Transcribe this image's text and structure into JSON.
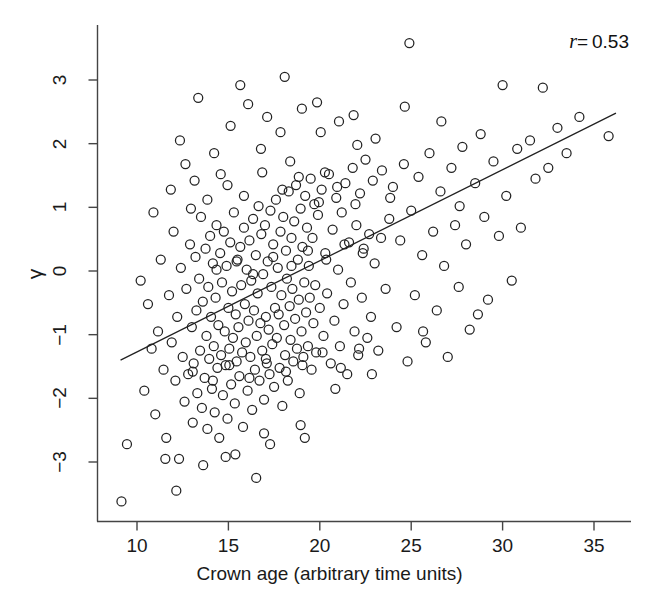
{
  "chart_data": {
    "type": "scatter",
    "title": "",
    "xlabel": "Crown age (arbitrary time units)",
    "ylabel": "γ",
    "xlim": [
      8.4,
      37.2
    ],
    "ylim": [
      -3.9,
      3.8
    ],
    "xticks": [
      10,
      15,
      20,
      25,
      30,
      35
    ],
    "xtick_labels": [
      "10",
      "15",
      "20",
      "25",
      "30",
      "35"
    ],
    "yticks": [
      -3,
      -2,
      -1,
      0,
      1,
      2,
      3
    ],
    "ytick_labels": [
      "-3",
      "-2",
      "-1",
      "0",
      "1",
      "2",
      "3"
    ],
    "grid": false,
    "legend": null,
    "marker": "open-circle",
    "marker_size_px": 9,
    "marker_color": "#222222",
    "marker_fill": "none",
    "annotations": [
      {
        "name": "correlation",
        "symbol": "r",
        "equals": "=",
        "value": "0.53",
        "text": "r = 0.53",
        "position": "top-right"
      }
    ],
    "fit_line": {
      "type": "linear",
      "x0": 9.1,
      "y0": -1.4,
      "x1": 36.2,
      "y1": 2.48,
      "slope": 0.1432,
      "intercept": -2.703,
      "color": "#222222",
      "width_px": 1.3
    },
    "n_points": 812,
    "correlation_r": 0.53,
    "points_note": "Dense elliptical cloud, positively correlated; core concentration at age 14-20, gamma -1.2 to 0.8; sparse tails to age 36 and gamma +3.6 / -3.6.",
    "points": [
      [
        9.15,
        -3.62
      ],
      [
        9.45,
        -2.72
      ],
      [
        10.4,
        -1.88
      ],
      [
        10.6,
        -0.52
      ],
      [
        10.8,
        -1.22
      ],
      [
        11.0,
        -2.25
      ],
      [
        11.15,
        -0.95
      ],
      [
        11.3,
        0.18
      ],
      [
        11.45,
        -1.55
      ],
      [
        11.6,
        -2.62
      ],
      [
        11.75,
        -0.38
      ],
      [
        11.9,
        -1.12
      ],
      [
        12.0,
        0.62
      ],
      [
        12.1,
        -1.72
      ],
      [
        12.2,
        -0.72
      ],
      [
        12.3,
        -2.95
      ],
      [
        12.4,
        0.05
      ],
      [
        12.5,
        -1.35
      ],
      [
        12.6,
        -2.05
      ],
      [
        12.7,
        -0.28
      ],
      [
        12.8,
        -1.62
      ],
      [
        12.9,
        0.42
      ],
      [
        13.0,
        -0.88
      ],
      [
        13.05,
        -2.38
      ],
      [
        13.1,
        -1.45
      ],
      [
        13.2,
        0.22
      ],
      [
        13.25,
        -0.62
      ],
      [
        13.3,
        -1.92
      ],
      [
        13.4,
        -0.12
      ],
      [
        13.45,
        -1.25
      ],
      [
        13.5,
        0.85
      ],
      [
        13.55,
        -2.15
      ],
      [
        13.6,
        -0.48
      ],
      [
        13.7,
        -1.68
      ],
      [
        13.75,
        0.35
      ],
      [
        13.8,
        -1.02
      ],
      [
        13.85,
        -2.48
      ],
      [
        13.9,
        -0.25
      ],
      [
        13.95,
        -1.38
      ],
      [
        14.0,
        0.55
      ],
      [
        14.05,
        -0.72
      ],
      [
        14.1,
        -1.85
      ],
      [
        14.15,
        0.12
      ],
      [
        14.2,
        -1.18
      ],
      [
        14.25,
        -2.22
      ],
      [
        14.3,
        -0.42
      ],
      [
        14.35,
        0.72
      ],
      [
        14.4,
        -1.52
      ],
      [
        14.45,
        -0.85
      ],
      [
        14.5,
        -2.62
      ],
      [
        14.55,
        0.28
      ],
      [
        14.6,
        -1.32
      ],
      [
        14.65,
        -0.18
      ],
      [
        14.7,
        -1.95
      ],
      [
        14.75,
        0.62
      ],
      [
        14.8,
        -0.95
      ],
      [
        14.85,
        -1.48
      ],
      [
        14.9,
        0.08
      ],
      [
        14.95,
        -2.32
      ],
      [
        15.0,
        -0.58
      ],
      [
        15.05,
        -1.22
      ],
      [
        15.1,
        0.45
      ],
      [
        15.15,
        -1.78
      ],
      [
        15.2,
        -0.32
      ],
      [
        15.25,
        -1.05
      ],
      [
        15.3,
        0.92
      ],
      [
        15.35,
        -2.08
      ],
      [
        15.4,
        -0.68
      ],
      [
        15.45,
        -1.42
      ],
      [
        15.5,
        0.18
      ],
      [
        15.55,
        -0.88
      ],
      [
        15.6,
        -1.65
      ],
      [
        15.65,
        0.38
      ],
      [
        15.7,
        -0.22
      ],
      [
        15.75,
        -1.28
      ],
      [
        15.8,
        -2.45
      ],
      [
        15.85,
        0.68
      ],
      [
        15.9,
        -0.52
      ],
      [
        15.95,
        -1.12
      ],
      [
        16.0,
        0.02
      ],
      [
        16.05,
        -1.88
      ],
      [
        16.1,
        -0.78
      ],
      [
        16.15,
        0.48
      ],
      [
        16.2,
        -1.35
      ],
      [
        16.25,
        -0.15
      ],
      [
        16.3,
        -2.18
      ],
      [
        16.35,
        0.82
      ],
      [
        16.4,
        -0.62
      ],
      [
        16.45,
        -1.55
      ],
      [
        16.5,
        0.25
      ],
      [
        16.55,
        -1.02
      ],
      [
        16.6,
        -0.35
      ],
      [
        16.65,
        1.02
      ],
      [
        16.7,
        -1.72
      ],
      [
        16.75,
        -0.82
      ],
      [
        16.8,
        0.58
      ],
      [
        16.85,
        -1.25
      ],
      [
        16.9,
        -0.05
      ],
      [
        16.95,
        -2.02
      ],
      [
        17.0,
        0.72
      ],
      [
        17.05,
        -0.72
      ],
      [
        17.1,
        -1.45
      ],
      [
        17.15,
        0.15
      ],
      [
        17.2,
        -0.92
      ],
      [
        17.25,
        -1.62
      ],
      [
        17.3,
        0.95
      ],
      [
        17.35,
        -0.25
      ],
      [
        17.4,
        -1.15
      ],
      [
        17.45,
        0.42
      ],
      [
        17.5,
        -1.82
      ],
      [
        17.55,
        -0.58
      ],
      [
        17.6,
        1.12
      ],
      [
        17.65,
        -1.05
      ],
      [
        17.7,
        0.05
      ],
      [
        17.75,
        -0.68
      ],
      [
        17.8,
        -1.52
      ],
      [
        17.85,
        0.62
      ],
      [
        17.9,
        -0.38
      ],
      [
        17.95,
        -2.12
      ],
      [
        18.0,
        0.85
      ],
      [
        18.05,
        -0.85
      ],
      [
        18.1,
        -1.32
      ],
      [
        18.15,
        0.32
      ],
      [
        18.2,
        -0.12
      ],
      [
        18.25,
        -1.72
      ],
      [
        18.3,
        1.25
      ],
      [
        18.35,
        -0.55
      ],
      [
        18.4,
        -1.08
      ],
      [
        18.45,
        0.52
      ],
      [
        18.5,
        -0.28
      ],
      [
        18.55,
        -1.42
      ],
      [
        18.6,
        0.78
      ],
      [
        18.65,
        -0.75
      ],
      [
        18.7,
        1.35
      ],
      [
        18.75,
        -1.22
      ],
      [
        18.8,
        0.18
      ],
      [
        18.85,
        -0.45
      ],
      [
        18.9,
        -1.92
      ],
      [
        18.95,
        0.98
      ],
      [
        19.0,
        -0.95
      ],
      [
        19.05,
        0.38
      ],
      [
        19.1,
        -1.35
      ],
      [
        19.15,
        -0.18
      ],
      [
        19.2,
        1.18
      ],
      [
        19.25,
        -0.65
      ],
      [
        19.3,
        0.68
      ],
      [
        19.35,
        -1.18
      ],
      [
        19.4,
        0.08
      ],
      [
        19.45,
        -0.42
      ],
      [
        19.5,
        1.45
      ],
      [
        19.55,
        -1.55
      ],
      [
        19.6,
        0.52
      ],
      [
        19.65,
        -0.82
      ],
      [
        19.7,
        1.05
      ],
      [
        19.75,
        -0.22
      ],
      [
        19.8,
        -1.28
      ],
      [
        19.9,
        0.88
      ],
      [
        20.0,
        -0.58
      ],
      [
        20.1,
        1.28
      ],
      [
        20.2,
        -1.02
      ],
      [
        20.3,
        0.28
      ],
      [
        20.4,
        -0.35
      ],
      [
        20.5,
        1.52
      ],
      [
        20.6,
        -1.45
      ],
      [
        20.7,
        0.65
      ],
      [
        20.8,
        -0.78
      ],
      [
        20.9,
        1.15
      ],
      [
        21.0,
        0.02
      ],
      [
        21.1,
        -1.18
      ],
      [
        21.2,
        0.92
      ],
      [
        21.3,
        -0.52
      ],
      [
        21.4,
        1.38
      ],
      [
        21.5,
        -1.62
      ],
      [
        21.6,
        0.45
      ],
      [
        21.7,
        -0.18
      ],
      [
        21.8,
        1.62
      ],
      [
        21.9,
        -0.95
      ],
      [
        22.0,
        0.72
      ],
      [
        22.1,
        -1.32
      ],
      [
        22.2,
        1.22
      ],
      [
        22.3,
        -0.42
      ],
      [
        22.4,
        0.35
      ],
      [
        22.5,
        1.75
      ],
      [
        22.6,
        -1.05
      ],
      [
        22.7,
        0.58
      ],
      [
        22.8,
        -0.72
      ],
      [
        22.9,
        1.42
      ],
      [
        23.0,
        0.12
      ],
      [
        23.2,
        -1.25
      ],
      [
        23.4,
        1.58
      ],
      [
        23.6,
        -0.28
      ],
      [
        23.8,
        0.82
      ],
      [
        24.0,
        1.32
      ],
      [
        24.2,
        -0.88
      ],
      [
        24.4,
        0.48
      ],
      [
        24.6,
        1.68
      ],
      [
        24.8,
        -1.42
      ],
      [
        24.9,
        3.58
      ],
      [
        25.0,
        0.95
      ],
      [
        25.2,
        -0.38
      ],
      [
        25.4,
        1.48
      ],
      [
        25.6,
        0.25
      ],
      [
        25.8,
        -1.12
      ],
      [
        26.0,
        1.85
      ],
      [
        26.2,
        0.62
      ],
      [
        26.4,
        -0.62
      ],
      [
        26.6,
        1.25
      ],
      [
        26.8,
        0.08
      ],
      [
        27.0,
        -1.35
      ],
      [
        27.2,
        1.62
      ],
      [
        27.4,
        0.72
      ],
      [
        27.6,
        -0.25
      ],
      [
        27.8,
        1.95
      ],
      [
        28.0,
        0.42
      ],
      [
        28.2,
        -0.92
      ],
      [
        28.5,
        1.38
      ],
      [
        28.8,
        2.15
      ],
      [
        29.0,
        0.85
      ],
      [
        29.2,
        -0.45
      ],
      [
        29.5,
        1.72
      ],
      [
        29.8,
        0.55
      ],
      [
        30.0,
        2.92
      ],
      [
        30.2,
        1.18
      ],
      [
        30.5,
        -0.15
      ],
      [
        30.8,
        1.92
      ],
      [
        31.0,
        0.68
      ],
      [
        31.5,
        2.05
      ],
      [
        31.8,
        1.45
      ],
      [
        32.2,
        2.88
      ],
      [
        32.5,
        1.62
      ],
      [
        33.0,
        2.25
      ],
      [
        33.5,
        1.85
      ],
      [
        34.2,
        2.42
      ],
      [
        35.8,
        2.12
      ],
      [
        12.35,
        2.05
      ],
      [
        13.15,
        1.42
      ],
      [
        14.22,
        1.85
      ],
      [
        15.12,
        2.28
      ],
      [
        16.08,
        2.62
      ],
      [
        17.12,
        2.42
      ],
      [
        18.08,
        3.05
      ],
      [
        19.02,
        2.55
      ],
      [
        20.05,
        2.18
      ],
      [
        21.05,
        2.35
      ],
      [
        22.05,
        1.98
      ],
      [
        23.05,
        2.08
      ],
      [
        13.62,
        -3.05
      ],
      [
        15.38,
        -2.88
      ],
      [
        17.28,
        -2.72
      ],
      [
        19.18,
        -2.62
      ],
      [
        16.52,
        -3.25
      ],
      [
        11.85,
        1.28
      ],
      [
        12.65,
        1.68
      ],
      [
        14.58,
        1.52
      ],
      [
        16.78,
        1.92
      ],
      [
        18.38,
        1.72
      ],
      [
        20.28,
        1.55
      ],
      [
        10.2,
        -0.15
      ],
      [
        10.9,
        0.92
      ],
      [
        11.55,
        -2.95
      ],
      [
        12.15,
        -3.45
      ],
      [
        13.35,
        2.72
      ],
      [
        14.85,
        -2.92
      ],
      [
        15.65,
        2.92
      ],
      [
        16.95,
        -2.55
      ],
      [
        17.85,
        2.18
      ],
      [
        18.95,
        -2.42
      ],
      [
        19.85,
        2.65
      ],
      [
        20.85,
        -1.85
      ],
      [
        21.85,
        2.45
      ],
      [
        22.85,
        -1.62
      ],
      [
        23.85,
        1.15
      ],
      [
        24.65,
        2.58
      ],
      [
        25.65,
        -0.95
      ],
      [
        26.65,
        2.35
      ],
      [
        27.65,
        1.02
      ],
      [
        28.65,
        -0.68
      ],
      [
        12.95,
        0.98
      ],
      [
        13.85,
        1.12
      ],
      [
        14.95,
        1.35
      ],
      [
        15.85,
        1.18
      ],
      [
        16.85,
        1.55
      ],
      [
        17.95,
        1.28
      ],
      [
        18.85,
        1.48
      ],
      [
        19.95,
        1.08
      ],
      [
        20.95,
        1.32
      ],
      [
        21.95,
        1.05
      ],
      [
        13.05,
        -1.58
      ],
      [
        14.15,
        -1.72
      ],
      [
        15.05,
        -1.48
      ],
      [
        16.15,
        -1.68
      ],
      [
        17.05,
        -1.38
      ],
      [
        18.15,
        -1.58
      ],
      [
        19.05,
        -1.48
      ],
      [
        20.15,
        -1.28
      ],
      [
        21.15,
        -1.52
      ],
      [
        22.15,
        -1.22
      ],
      [
        14.35,
        0.02
      ],
      [
        15.45,
        0.15
      ],
      [
        16.35,
        -0.05
      ],
      [
        17.45,
        0.22
      ],
      [
        18.45,
        0.08
      ],
      [
        19.35,
        0.32
      ],
      [
        20.35,
        0.18
      ],
      [
        21.35,
        0.42
      ],
      [
        22.35,
        0.28
      ],
      [
        23.35,
        0.52
      ]
    ]
  },
  "figure": {
    "annotation_text": "r = 0.53",
    "r_symbol": "r",
    "r_equals": "=",
    "r_value": "0.53"
  }
}
